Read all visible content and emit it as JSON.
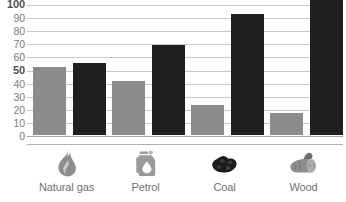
{
  "chart_data": {
    "type": "bar",
    "title": "",
    "subtitle": "",
    "xlabel": "",
    "ylabel": "",
    "ylim": [
      0,
      100
    ],
    "grid": true,
    "legend_position": "none",
    "categories": [
      "Natural gas",
      "Petrol",
      "Coal",
      "Wood"
    ],
    "ytick_labels": [
      "100",
      "90",
      "80",
      "70",
      "60",
      "50",
      "40",
      "30",
      "20",
      "10",
      "0"
    ],
    "ytick_values": [
      100,
      90,
      80,
      70,
      60,
      50,
      40,
      30,
      20,
      10,
      0
    ],
    "ytick_bold": [
      true,
      false,
      false,
      false,
      false,
      true,
      false,
      false,
      false,
      false,
      false
    ],
    "series": [
      {
        "name": "light-series",
        "color": "#8c8c8c",
        "values": [
          52,
          41,
          23,
          17
        ]
      },
      {
        "name": "dark-series",
        "color": "#1f1f1f",
        "values": [
          55,
          69,
          92,
          105
        ]
      }
    ],
    "category_icons": [
      "flame-icon",
      "jerrycan-icon",
      "coal-lump-icon",
      "wood-log-icon"
    ]
  },
  "colors": {
    "light_bar": "#8c8c8c",
    "dark_bar": "#1f1f1f",
    "gridline": "#c9c9c9",
    "axis_text": "#7b7b7b",
    "axis_text_bold": "#4f4f4f",
    "label_text": "#6f6f6f",
    "background": "#ffffff"
  }
}
